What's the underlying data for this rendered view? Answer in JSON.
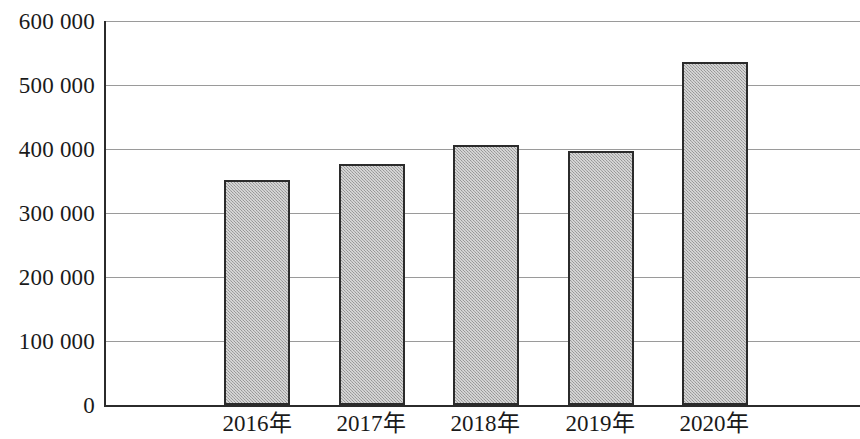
{
  "chart_data": {
    "type": "bar",
    "title": "",
    "subtitle": "",
    "xlabel": "",
    "ylabel": "",
    "categories": [
      "2016年",
      "2017年",
      "2018年",
      "2019年",
      "2020年"
    ],
    "values": [
      351000,
      376000,
      406000,
      397000,
      536000
    ],
    "ylim": [
      0,
      600000
    ],
    "ytick_values": [
      0,
      100000,
      200000,
      300000,
      400000,
      500000,
      600000
    ],
    "ytick_labels": [
      "0",
      "100 000",
      "200 000",
      "300 000",
      "400 000",
      "500 000",
      "600 000"
    ],
    "grid": true,
    "legend": null,
    "legend_position": "none",
    "series": [
      {
        "name": "",
        "values": [
          351000,
          376000,
          406000,
          397000,
          536000
        ]
      }
    ],
    "annotations": [],
    "bar_fill_color": "#a9a9a9",
    "bar_border_color": "#2b2b2b",
    "gridline_color": "#9a9a9a",
    "axis_color": "#2b2b2b",
    "background_color": "#ffffff"
  }
}
